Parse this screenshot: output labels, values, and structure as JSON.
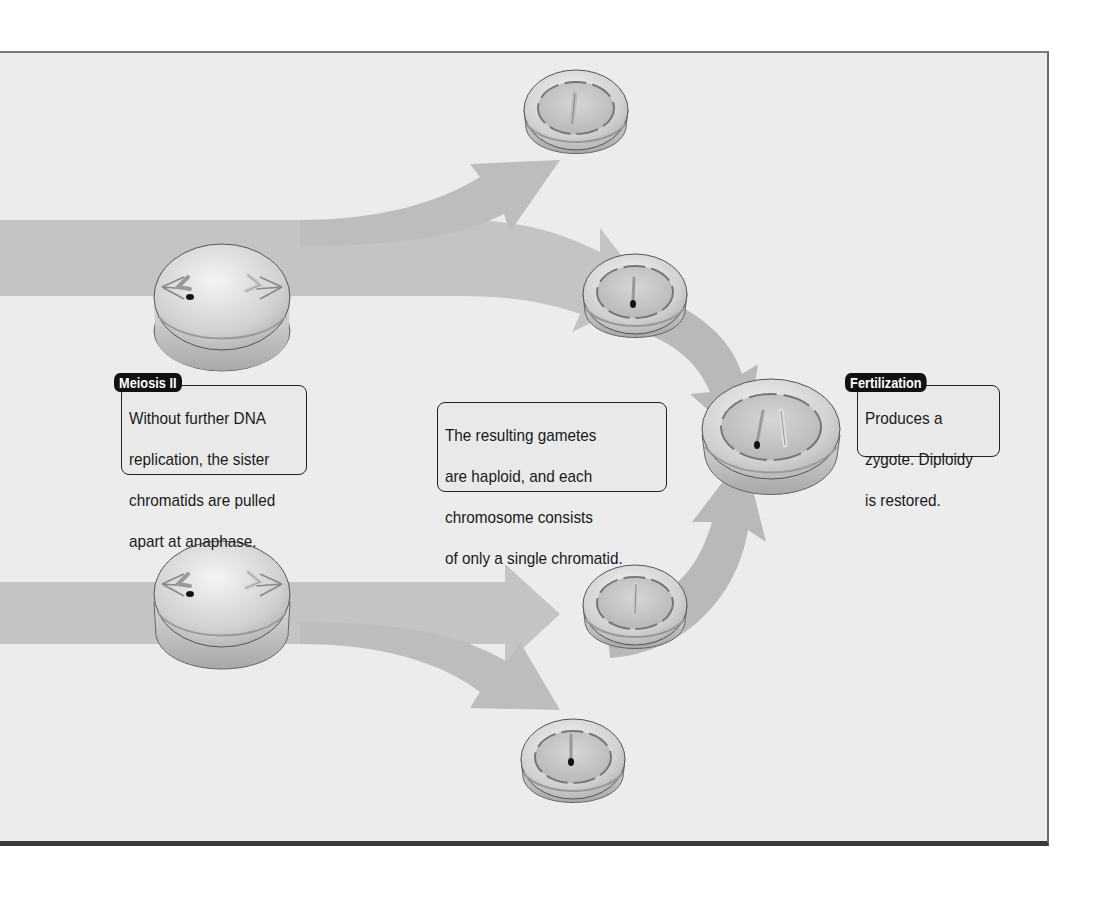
{
  "diagram": {
    "type": "meiosis-fertilization-flow",
    "background_color": "#ececec",
    "arrow_color": "#c4c4c4",
    "callouts": {
      "meiosis_ii": {
        "tag": "Meiosis II",
        "lines": [
          "Without further DNA",
          "replication, the sister",
          "chromatids are pulled",
          "apart at anaphase."
        ]
      },
      "gametes": {
        "lines": [
          "The resulting gametes",
          "are haploid, and each",
          "chromosome consists",
          "of only a single chromatid."
        ]
      },
      "fertilization": {
        "tag": "Fertilization",
        "lines": [
          "Produces a",
          "zygote. Diploidy",
          "is restored."
        ]
      }
    },
    "cells": [
      {
        "id": "anaphase-cell-top",
        "stage": "Meiosis II anaphase"
      },
      {
        "id": "anaphase-cell-bottom",
        "stage": "Meiosis II anaphase"
      },
      {
        "id": "gamete-1",
        "chromosome": "light"
      },
      {
        "id": "gamete-2",
        "chromosome": "dark"
      },
      {
        "id": "gamete-3",
        "chromosome": "light"
      },
      {
        "id": "gamete-4",
        "chromosome": "dark"
      },
      {
        "id": "zygote",
        "chromosomes": [
          "dark",
          "light"
        ]
      }
    ]
  }
}
